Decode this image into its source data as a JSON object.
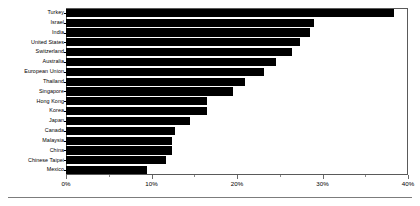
{
  "chart_data": {
    "type": "bar",
    "orientation": "horizontal",
    "title": "",
    "subtitle": "",
    "xlabel": "",
    "ylabel": "",
    "xlim": [
      0,
      40
    ],
    "xunit": "%",
    "grid": false,
    "legend": null,
    "bar_color": "#000000",
    "frame_color": "#5a5a5a",
    "xticks": [
      0,
      10,
      20,
      30,
      40
    ],
    "xtick_labels": [
      "0%",
      "10%",
      "20%",
      "30%",
      "40%"
    ],
    "xticks_minor": [
      5,
      15,
      25,
      35
    ],
    "categories": [
      "Turkey",
      "Israel",
      "India",
      "United States",
      "Switzerland",
      "Australia",
      "European Union",
      "Thailand",
      "Singapore",
      "Hong Kong",
      "Korea",
      "Japan",
      "Canada",
      "Malaysia",
      "China",
      "Chinese Taipei",
      "Mexico"
    ],
    "values": [
      38.4,
      29.0,
      28.5,
      27.4,
      26.4,
      24.6,
      23.2,
      20.9,
      19.5,
      16.5,
      16.5,
      14.5,
      12.7,
      12.4,
      12.4,
      11.7,
      9.5
    ]
  }
}
